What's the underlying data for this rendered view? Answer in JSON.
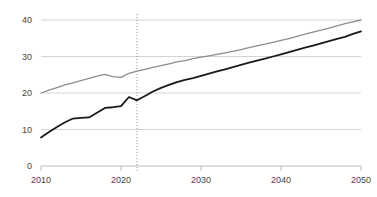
{
  "chart_data": {
    "type": "line",
    "title": "",
    "subtitle": "",
    "xlabel": "",
    "ylabel": "",
    "xlim": [
      2010,
      2050
    ],
    "ylim": [
      0,
      40
    ],
    "grid": true,
    "legend_position": "none",
    "x_ticks": [
      "2010",
      "2020",
      "2030",
      "2040",
      "2050"
    ],
    "x_tick_values": [
      2010,
      2020,
      2030,
      2040,
      2050
    ],
    "y_ticks": [
      "0",
      "10",
      "20",
      "30",
      "40"
    ],
    "y_tick_values": [
      0,
      10,
      20,
      30,
      40
    ],
    "annotations": [
      {
        "name": "projection-divider",
        "type": "vertical-dotted-line",
        "x": 2022,
        "label": ""
      }
    ],
    "x": [
      2010,
      2011,
      2012,
      2013,
      2014,
      2015,
      2016,
      2017,
      2018,
      2019,
      2020,
      2021,
      2022,
      2023,
      2024,
      2025,
      2026,
      2027,
      2028,
      2029,
      2030,
      2031,
      2032,
      2033,
      2034,
      2035,
      2036,
      2037,
      2038,
      2039,
      2040,
      2041,
      2042,
      2043,
      2044,
      2045,
      2046,
      2047,
      2048,
      2049,
      2050
    ],
    "series": [
      {
        "name": "upper-series",
        "color": "#8c8c8c",
        "width": 1.3,
        "values": [
          20.0,
          20.8,
          21.5,
          22.2,
          22.8,
          23.4,
          24.0,
          24.6,
          25.1,
          24.5,
          24.3,
          25.4,
          26.0,
          26.5,
          27.0,
          27.5,
          28.0,
          28.5,
          28.9,
          29.4,
          29.8,
          30.2,
          30.6,
          31.0,
          31.4,
          31.9,
          32.4,
          32.9,
          33.4,
          33.9,
          34.4,
          34.9,
          35.5,
          36.1,
          36.7,
          37.2,
          37.8,
          38.4,
          39.0,
          39.5,
          40.0
        ]
      },
      {
        "name": "lower-series",
        "color": "#1a1a1a",
        "width": 1.8,
        "values": [
          7.8,
          9.3,
          10.7,
          12.0,
          13.0,
          13.2,
          13.3,
          14.6,
          15.9,
          16.1,
          16.4,
          18.9,
          18.0,
          19.2,
          20.4,
          21.4,
          22.2,
          23.0,
          23.6,
          24.1,
          24.7,
          25.3,
          25.9,
          26.5,
          27.1,
          27.7,
          28.3,
          28.9,
          29.4,
          30.0,
          30.6,
          31.2,
          31.8,
          32.4,
          33.0,
          33.6,
          34.2,
          34.8,
          35.4,
          36.2,
          36.9
        ]
      }
    ]
  },
  "clipped_header": {
    "text": ""
  }
}
